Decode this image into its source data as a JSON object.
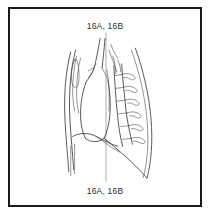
{
  "figure": {
    "label_top": "16A, 16B",
    "label_bottom": "16A, 16B",
    "frame_color": "#1a1a1a",
    "line_color": "#3a3a3a",
    "section_line_color": "#8a8a8a",
    "background_color": "#ffffff",
    "illustration_name": "lateral-chest-anatomical-line-drawing",
    "section_line_x": 98
  }
}
